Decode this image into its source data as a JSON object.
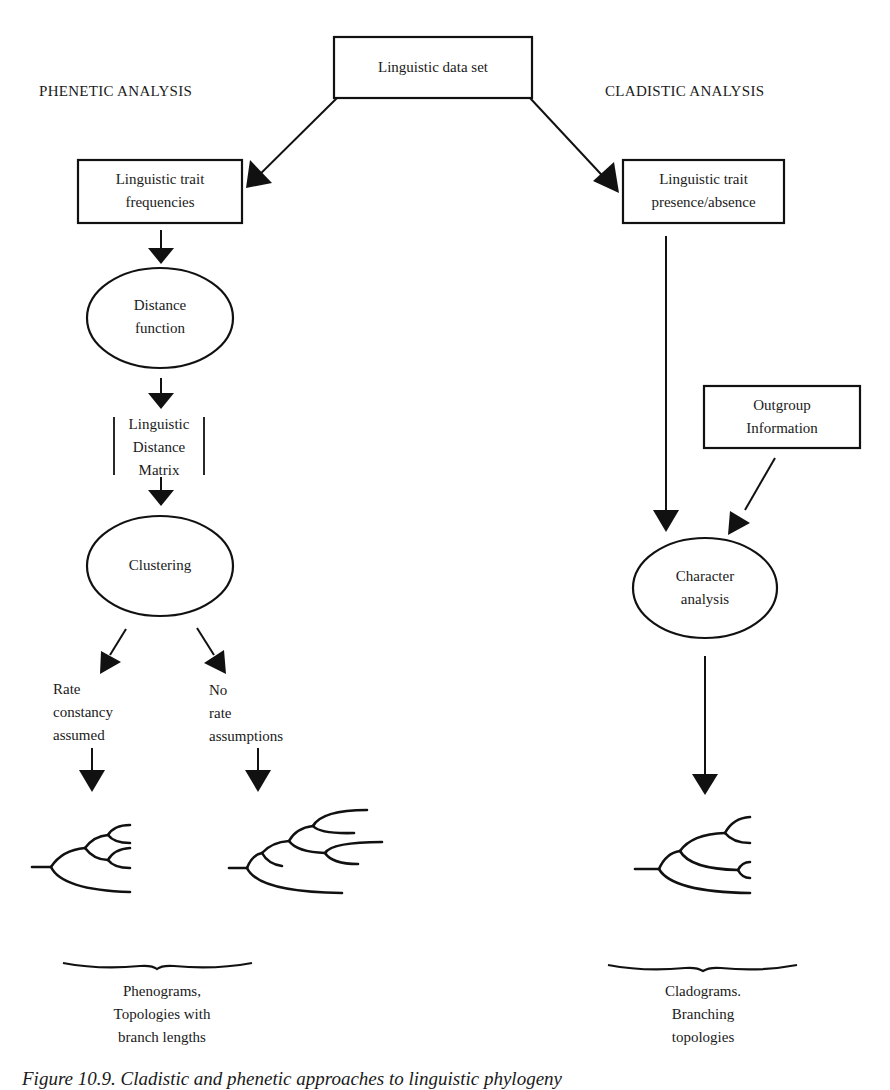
{
  "headers": {
    "phenetic": "PHENETIC ANALYSIS",
    "cladistic": "CLADISTIC ANALYSIS"
  },
  "nodes": {
    "data_set": {
      "label": "Linguistic data set",
      "shape": "box"
    },
    "trait_frequencies": {
      "line1": "Linguistic trait",
      "line2": "frequencies",
      "shape": "box"
    },
    "trait_presence": {
      "line1": "Linguistic trait",
      "line2": "presence/absence",
      "shape": "box"
    },
    "distance_function": {
      "line1": "Distance",
      "line2": "function",
      "shape": "ellipse"
    },
    "distance_matrix": {
      "line1": "Linguistic",
      "line2": "Distance",
      "line3": "Matrix",
      "shape": "matrix-brackets"
    },
    "clustering": {
      "label": "Clustering",
      "shape": "ellipse"
    },
    "outgroup": {
      "line1": "Outgroup",
      "line2": "Information",
      "shape": "box"
    },
    "character_analysis": {
      "line1": "Character",
      "line2": "analysis",
      "shape": "ellipse"
    }
  },
  "branches": {
    "rate_constancy": {
      "line1": "Rate",
      "line2": "constancy",
      "line3": "assumed"
    },
    "no_rate": {
      "line1": "No",
      "line2": "rate",
      "line3": "assumptions"
    }
  },
  "outputs": {
    "phenograms": {
      "line1": "Phenograms,",
      "line2": "Topologies with",
      "line3": "branch lengths"
    },
    "cladograms": {
      "line1": "Cladograms.",
      "line2": "Branching",
      "line3": "topologies"
    }
  },
  "edges": [
    {
      "from": "data_set",
      "to": "trait_frequencies"
    },
    {
      "from": "data_set",
      "to": "trait_presence"
    },
    {
      "from": "trait_frequencies",
      "to": "distance_function"
    },
    {
      "from": "distance_function",
      "to": "distance_matrix"
    },
    {
      "from": "distance_matrix",
      "to": "clustering"
    },
    {
      "from": "clustering",
      "to": "rate_constancy"
    },
    {
      "from": "clustering",
      "to": "no_rate"
    },
    {
      "from": "rate_constancy",
      "to": "phenogram_ultrametric"
    },
    {
      "from": "no_rate",
      "to": "phenogram_additive"
    },
    {
      "from": "trait_presence",
      "to": "character_analysis"
    },
    {
      "from": "outgroup",
      "to": "character_analysis"
    },
    {
      "from": "character_analysis",
      "to": "cladogram"
    }
  ],
  "caption": "Figure 10.9. Cladistic and phenetic approaches to linguistic phylogeny"
}
